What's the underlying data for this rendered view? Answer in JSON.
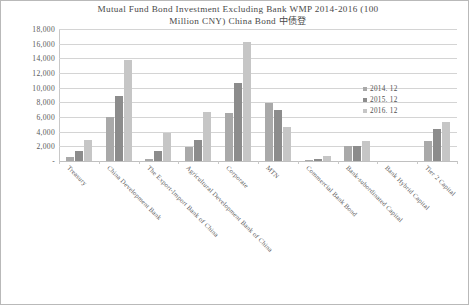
{
  "chart_data": {
    "type": "bar",
    "title": "Mutual Fund Bond Investment Excluding Bank WMP 2014-2016 (100 Million CNY) China Bond 中债登",
    "title_line1": "Mutual Fund Bond Investment Excluding Bank WMP 2014-2016 (100",
    "title_line2": "Million CNY) China Bond 中债登",
    "xlabel": "",
    "ylabel": "",
    "ylim": [
      0,
      18000
    ],
    "ytick_step": 2000,
    "grid": true,
    "legend_position": "right",
    "categories": [
      "Treasury",
      "China Development Bank",
      "The Export-Import Bank of China",
      "Agricultural Development Bank of China",
      "Corporate",
      "MTN",
      "Commercial Bank Bond",
      "Bank-subordinated Capital",
      "Bank Hybrid Capital",
      "Tier 2 Capital"
    ],
    "ytick_labels": [
      "18,000",
      "16,000",
      "14,000",
      "12,000",
      "10,000",
      "8,000",
      "6,000",
      "4,000",
      "2,000",
      "-"
    ],
    "ytick_values": [
      18000,
      16000,
      14000,
      12000,
      10000,
      8000,
      6000,
      4000,
      2000,
      0
    ],
    "series": [
      {
        "name": "2014. 12",
        "color": "#a9a9a9",
        "values": [
          600,
          6000,
          300,
          1900,
          6600,
          7900,
          150,
          2100,
          0,
          2700
        ]
      },
      {
        "name": "2015. 12",
        "color": "#8c8c8c",
        "values": [
          1400,
          8800,
          1400,
          2800,
          10700,
          7000,
          250,
          2100,
          0,
          4400
        ]
      },
      {
        "name": "2016. 12",
        "color": "#c6c6c6",
        "values": [
          2800,
          13800,
          3800,
          6700,
          16200,
          4700,
          750,
          2700,
          0,
          5300
        ]
      }
    ]
  }
}
